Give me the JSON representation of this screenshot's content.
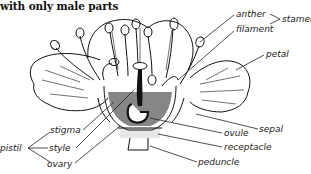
{
  "title": "with only male parts",
  "labels": {
    "anther": "anther",
    "filament": "filament",
    "stamen": "stamen",
    "petal": "petal",
    "sepal": "sepal",
    "ovule": "ovule",
    "receptacle": "receptacle",
    "peduncle": "peduncle",
    "stigma": "stigma",
    "style": "style",
    "ovary": "ovary",
    "pistil": "pistil"
  },
  "colors": {
    "ink": "#111111",
    "background": "#ffffff"
  }
}
